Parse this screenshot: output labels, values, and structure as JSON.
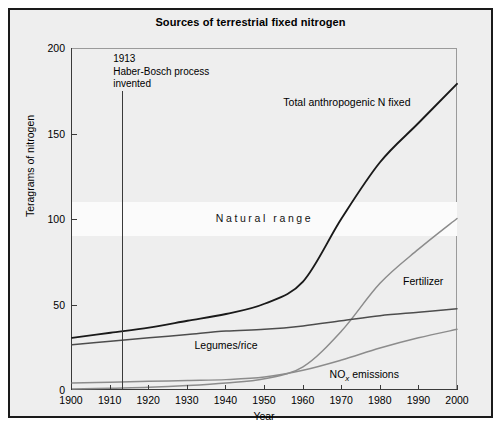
{
  "chart_data": {
    "type": "line",
    "title": "Sources of terrestrial fixed nitrogen",
    "xlabel": "Year",
    "ylabel": "Teragrams of nitrogen",
    "xlim": [
      1900,
      2000
    ],
    "ylim": [
      0,
      200
    ],
    "xticks": [
      1900,
      1910,
      1920,
      1930,
      1940,
      1950,
      1960,
      1970,
      1980,
      1990,
      2000
    ],
    "yticks": [
      0,
      50,
      100,
      150,
      200
    ],
    "grid": false,
    "legend": "inline-labels",
    "x": [
      1900,
      1910,
      1920,
      1930,
      1940,
      1950,
      1960,
      1970,
      1980,
      1990,
      2000
    ],
    "series": [
      {
        "name": "Total anthropogenic N fixed",
        "label": "Total anthropogenic N fixed",
        "color": "#1a1a1a",
        "values": [
          30,
          33,
          36,
          40,
          44,
          50,
          63,
          100,
          133,
          156,
          179
        ]
      },
      {
        "name": "Fertilizer",
        "label": "Fertilizer",
        "color": "#8c8c8c",
        "values": [
          0,
          0.5,
          1,
          2,
          3.5,
          6,
          13,
          34,
          62,
          82,
          100
        ]
      },
      {
        "name": "Legumes/rice",
        "label": "Legumes/rice",
        "color": "#4d4d4d",
        "values": [
          26,
          28,
          30,
          32,
          34,
          35,
          37,
          40,
          43,
          45,
          47
        ]
      },
      {
        "name": "NOx emissions",
        "label": "NO",
        "label_sub": "x",
        "label_tail": " emissions",
        "color": "#8c8c8c",
        "values": [
          3.5,
          4,
          4.5,
          5,
          5.5,
          7,
          11,
          17,
          24,
          30,
          35
        ]
      }
    ],
    "bands": [
      {
        "name": "Natural range",
        "label": "Natural range",
        "y_from": 90,
        "y_to": 110,
        "color": "#fbfbfb"
      }
    ],
    "annotations": [
      {
        "name": "haber-bosch-event",
        "year": 1913,
        "line1": "1913",
        "line2": "Haber-Bosch process",
        "line3": "invented"
      }
    ]
  }
}
